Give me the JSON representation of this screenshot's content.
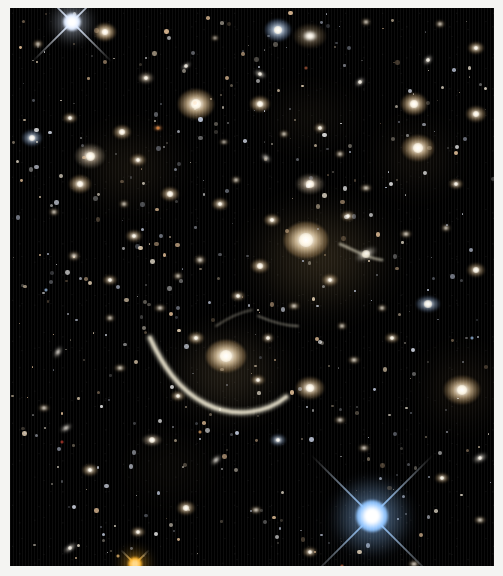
{
  "image": {
    "kind": "astronomical-deep-field-photograph",
    "subject": "galaxy cluster with gravitational lensing arc",
    "border_color": "#f4f4f2",
    "sky_color": "#000000",
    "width": 503,
    "height": 576,
    "plate": {
      "x": 10,
      "y": 8,
      "w": 484,
      "h": 558
    }
  },
  "palette": {
    "elliptical_core": "#fffaf0",
    "elliptical_halo": "#c8a878",
    "spiral_blue": "#cfe0f5",
    "star_white": "#ffffff",
    "star_blue": "#bcd8ff",
    "star_gold": "#ffc24a",
    "arc": "#e8e2cc",
    "red_dot": "#c0392b",
    "orange_dot": "#e07a30"
  },
  "diffuse_light": [
    {
      "x": 310,
      "y": 250,
      "rx": 78,
      "ry": 62,
      "color": "#8a7248",
      "alpha": 0.34
    },
    {
      "x": 218,
      "y": 365,
      "rx": 62,
      "ry": 50,
      "color": "#8a7450",
      "alpha": 0.3
    },
    {
      "x": 120,
      "y": 160,
      "rx": 58,
      "ry": 46,
      "color": "#6e5a3a",
      "alpha": 0.22
    },
    {
      "x": 408,
      "y": 150,
      "rx": 46,
      "ry": 40,
      "color": "#6a563a",
      "alpha": 0.2
    },
    {
      "x": 452,
      "y": 380,
      "rx": 44,
      "ry": 44,
      "color": "#6e5838",
      "alpha": 0.22
    },
    {
      "x": 300,
      "y": 110,
      "rx": 52,
      "ry": 34,
      "color": "#5e4e34",
      "alpha": 0.18
    },
    {
      "x": 160,
      "y": 460,
      "rx": 50,
      "ry": 40,
      "color": "#4e4028",
      "alpha": 0.14
    },
    {
      "x": 360,
      "y": 520,
      "rx": 56,
      "ry": 44,
      "color": "#3c4a60",
      "alpha": 0.16
    }
  ],
  "bright_stars": [
    {
      "name": "star-top-left-white",
      "x": 62,
      "y": 14,
      "size": 9,
      "color": "#ffffff",
      "spike": 56,
      "tint": "#dbe8ff"
    },
    {
      "name": "star-bottom-right-blue",
      "x": 362,
      "y": 508,
      "size": 16,
      "color": "#ffffff",
      "spike": 86,
      "tint": "#8fc4ff"
    },
    {
      "name": "star-bottom-gold",
      "x": 125,
      "y": 556,
      "size": 7,
      "color": "#ffd98a",
      "spike": 20,
      "tint": "#ffb224"
    }
  ],
  "lensing_arc": {
    "name": "dragon-arc",
    "color": "#e9e3cd",
    "description": "long curved gravitationally lensed arc sweeping below the central cluster galaxies"
  },
  "galaxies": [
    {
      "x": 95,
      "y": 24,
      "rx": 11,
      "ry": 9,
      "type": "elliptical",
      "b": 0.95
    },
    {
      "x": 28,
      "y": 36,
      "rx": 5,
      "ry": 4,
      "type": "elliptical",
      "b": 0.55
    },
    {
      "x": 176,
      "y": 58,
      "rx": 6,
      "ry": 3,
      "type": "edge-on",
      "b": 0.6,
      "rot": -35
    },
    {
      "x": 136,
      "y": 70,
      "rx": 8,
      "ry": 6,
      "type": "spiral",
      "b": 0.62
    },
    {
      "x": 268,
      "y": 22,
      "rx": 13,
      "ry": 11,
      "type": "spiral-blue",
      "b": 0.88
    },
    {
      "x": 250,
      "y": 66,
      "rx": 7,
      "ry": 4,
      "type": "edge-on",
      "b": 0.58,
      "rot": 25
    },
    {
      "x": 300,
      "y": 28,
      "rx": 16,
      "ry": 12,
      "type": "elliptical",
      "b": 0.45
    },
    {
      "x": 205,
      "y": 30,
      "rx": 4,
      "ry": 3,
      "type": "compact",
      "b": 0.5
    },
    {
      "x": 356,
      "y": 14,
      "rx": 5,
      "ry": 4,
      "type": "compact",
      "b": 0.5
    },
    {
      "x": 430,
      "y": 16,
      "rx": 5,
      "ry": 4,
      "type": "compact",
      "b": 0.55
    },
    {
      "x": 466,
      "y": 40,
      "rx": 8,
      "ry": 6,
      "type": "elliptical",
      "b": 0.72
    },
    {
      "x": 418,
      "y": 52,
      "rx": 6,
      "ry": 4,
      "type": "edge-on",
      "b": 0.6,
      "rot": -50
    },
    {
      "x": 350,
      "y": 74,
      "rx": 6,
      "ry": 4,
      "type": "edge-on",
      "b": 0.58,
      "rot": -40
    },
    {
      "x": 186,
      "y": 96,
      "rx": 18,
      "ry": 15,
      "type": "elliptical",
      "b": 1.0
    },
    {
      "x": 250,
      "y": 96,
      "rx": 10,
      "ry": 8,
      "type": "elliptical",
      "b": 0.8
    },
    {
      "x": 404,
      "y": 96,
      "rx": 13,
      "ry": 11,
      "type": "elliptical",
      "b": 0.9
    },
    {
      "x": 466,
      "y": 106,
      "rx": 10,
      "ry": 8,
      "type": "elliptical",
      "b": 0.75
    },
    {
      "x": 60,
      "y": 110,
      "rx": 7,
      "ry": 5,
      "type": "elliptical",
      "b": 0.6
    },
    {
      "x": 112,
      "y": 124,
      "rx": 9,
      "ry": 7,
      "type": "elliptical",
      "b": 0.72
    },
    {
      "x": 310,
      "y": 120,
      "rx": 6,
      "ry": 5,
      "type": "compact",
      "b": 0.6
    },
    {
      "x": 80,
      "y": 148,
      "rx": 15,
      "ry": 12,
      "type": "spiral",
      "b": 0.82
    },
    {
      "x": 128,
      "y": 152,
      "rx": 8,
      "ry": 6,
      "type": "elliptical",
      "b": 0.65
    },
    {
      "x": 70,
      "y": 176,
      "rx": 11,
      "ry": 9,
      "type": "elliptical",
      "b": 0.78
    },
    {
      "x": 22,
      "y": 130,
      "rx": 10,
      "ry": 8,
      "type": "spiral-blue",
      "b": 0.7
    },
    {
      "x": 148,
      "y": 120,
      "rx": 5,
      "ry": 3,
      "type": "orange-dot",
      "b": 0.5
    },
    {
      "x": 408,
      "y": 140,
      "rx": 16,
      "ry": 13,
      "type": "elliptical",
      "b": 0.95
    },
    {
      "x": 330,
      "y": 146,
      "rx": 5,
      "ry": 4,
      "type": "compact",
      "b": 0.55
    },
    {
      "x": 300,
      "y": 176,
      "rx": 14,
      "ry": 10,
      "type": "spiral",
      "b": 0.78
    },
    {
      "x": 256,
      "y": 150,
      "rx": 6,
      "ry": 4,
      "type": "edge-on",
      "b": 0.55,
      "rot": 40
    },
    {
      "x": 446,
      "y": 176,
      "rx": 7,
      "ry": 5,
      "type": "elliptical",
      "b": 0.62
    },
    {
      "x": 160,
      "y": 186,
      "rx": 9,
      "ry": 7,
      "type": "elliptical",
      "b": 0.72
    },
    {
      "x": 210,
      "y": 196,
      "rx": 8,
      "ry": 6,
      "type": "elliptical",
      "b": 0.68
    },
    {
      "x": 296,
      "y": 232,
      "rx": 22,
      "ry": 18,
      "type": "cD",
      "b": 1.0
    },
    {
      "x": 262,
      "y": 212,
      "rx": 8,
      "ry": 6,
      "type": "elliptical",
      "b": 0.7
    },
    {
      "x": 338,
      "y": 208,
      "rx": 7,
      "ry": 5,
      "type": "elliptical",
      "b": 0.62
    },
    {
      "x": 250,
      "y": 258,
      "rx": 9,
      "ry": 7,
      "type": "elliptical",
      "b": 0.72
    },
    {
      "x": 320,
      "y": 272,
      "rx": 8,
      "ry": 6,
      "type": "elliptical",
      "b": 0.68
    },
    {
      "x": 356,
      "y": 246,
      "rx": 12,
      "ry": 6,
      "type": "edge-on",
      "b": 0.7,
      "rot": -28
    },
    {
      "x": 228,
      "y": 288,
      "rx": 7,
      "ry": 5,
      "type": "elliptical",
      "b": 0.6
    },
    {
      "x": 284,
      "y": 298,
      "rx": 6,
      "ry": 4,
      "type": "compact",
      "b": 0.55
    },
    {
      "x": 124,
      "y": 228,
      "rx": 8,
      "ry": 6,
      "type": "elliptical",
      "b": 0.65
    },
    {
      "x": 64,
      "y": 248,
      "rx": 6,
      "ry": 5,
      "type": "compact",
      "b": 0.55
    },
    {
      "x": 100,
      "y": 272,
      "rx": 7,
      "ry": 5,
      "type": "elliptical",
      "b": 0.6
    },
    {
      "x": 150,
      "y": 300,
      "rx": 6,
      "ry": 4,
      "type": "compact",
      "b": 0.55
    },
    {
      "x": 418,
      "y": 296,
      "rx": 12,
      "ry": 8,
      "type": "spiral-blue",
      "b": 0.7
    },
    {
      "x": 466,
      "y": 262,
      "rx": 9,
      "ry": 7,
      "type": "elliptical",
      "b": 0.66
    },
    {
      "x": 216,
      "y": 348,
      "rx": 20,
      "ry": 16,
      "type": "cD",
      "b": 0.98
    },
    {
      "x": 186,
      "y": 330,
      "rx": 8,
      "ry": 6,
      "type": "elliptical",
      "b": 0.7
    },
    {
      "x": 258,
      "y": 330,
      "rx": 6,
      "ry": 5,
      "type": "compact",
      "b": 0.6
    },
    {
      "x": 248,
      "y": 372,
      "rx": 7,
      "ry": 5,
      "type": "elliptical",
      "b": 0.62
    },
    {
      "x": 168,
      "y": 388,
      "rx": 7,
      "ry": 5,
      "type": "elliptical",
      "b": 0.6
    },
    {
      "x": 300,
      "y": 380,
      "rx": 14,
      "ry": 11,
      "type": "elliptical",
      "b": 0.85
    },
    {
      "x": 344,
      "y": 352,
      "rx": 6,
      "ry": 4,
      "type": "compact",
      "b": 0.55
    },
    {
      "x": 452,
      "y": 382,
      "rx": 18,
      "ry": 14,
      "type": "elliptical",
      "b": 0.95
    },
    {
      "x": 382,
      "y": 330,
      "rx": 7,
      "ry": 5,
      "type": "elliptical",
      "b": 0.6
    },
    {
      "x": 110,
      "y": 360,
      "rx": 6,
      "ry": 4,
      "type": "compact",
      "b": 0.55
    },
    {
      "x": 48,
      "y": 344,
      "rx": 7,
      "ry": 4,
      "type": "edge-on",
      "b": 0.55,
      "rot": -60
    },
    {
      "x": 34,
      "y": 400,
      "rx": 6,
      "ry": 4,
      "type": "compact",
      "b": 0.5
    },
    {
      "x": 142,
      "y": 432,
      "rx": 10,
      "ry": 6,
      "type": "spiral",
      "b": 0.68
    },
    {
      "x": 80,
      "y": 462,
      "rx": 8,
      "ry": 6,
      "type": "elliptical",
      "b": 0.65
    },
    {
      "x": 56,
      "y": 420,
      "rx": 7,
      "ry": 4,
      "type": "edge-on",
      "b": 0.55,
      "rot": -30
    },
    {
      "x": 206,
      "y": 452,
      "rx": 7,
      "ry": 4,
      "type": "edge-on",
      "b": 0.55,
      "rot": -45
    },
    {
      "x": 268,
      "y": 432,
      "rx": 8,
      "ry": 6,
      "type": "spiral-blue",
      "b": 0.6
    },
    {
      "x": 176,
      "y": 500,
      "rx": 9,
      "ry": 7,
      "type": "elliptical",
      "b": 0.7
    },
    {
      "x": 246,
      "y": 502,
      "rx": 6,
      "ry": 4,
      "type": "compact",
      "b": 0.55
    },
    {
      "x": 128,
      "y": 524,
      "rx": 7,
      "ry": 5,
      "type": "elliptical",
      "b": 0.62
    },
    {
      "x": 60,
      "y": 540,
      "rx": 8,
      "ry": 4,
      "type": "edge-on",
      "b": 0.6,
      "rot": -35
    },
    {
      "x": 300,
      "y": 544,
      "rx": 7,
      "ry": 5,
      "type": "elliptical",
      "b": 0.6
    },
    {
      "x": 432,
      "y": 470,
      "rx": 7,
      "ry": 5,
      "type": "elliptical",
      "b": 0.6
    },
    {
      "x": 470,
      "y": 512,
      "rx": 6,
      "ry": 4,
      "type": "compact",
      "b": 0.55
    },
    {
      "x": 404,
      "y": 556,
      "rx": 6,
      "ry": 4,
      "type": "compact",
      "b": 0.5
    },
    {
      "x": 470,
      "y": 450,
      "rx": 8,
      "ry": 5,
      "type": "edge-on",
      "b": 0.6,
      "rot": -25
    },
    {
      "x": 354,
      "y": 440,
      "rx": 6,
      "ry": 4,
      "type": "compact",
      "b": 0.5
    },
    {
      "x": 332,
      "y": 318,
      "rx": 5,
      "ry": 4,
      "type": "compact",
      "b": 0.5
    },
    {
      "x": 396,
      "y": 226,
      "rx": 6,
      "ry": 4,
      "type": "compact",
      "b": 0.55
    },
    {
      "x": 372,
      "y": 300,
      "rx": 5,
      "ry": 4,
      "type": "compact",
      "b": 0.5
    },
    {
      "x": 190,
      "y": 252,
      "rx": 6,
      "ry": 5,
      "type": "compact",
      "b": 0.55
    },
    {
      "x": 168,
      "y": 268,
      "rx": 5,
      "ry": 4,
      "type": "compact",
      "b": 0.5
    },
    {
      "x": 226,
      "y": 172,
      "rx": 5,
      "ry": 4,
      "type": "compact",
      "b": 0.5
    },
    {
      "x": 356,
      "y": 180,
      "rx": 6,
      "ry": 4,
      "type": "compact",
      "b": 0.55
    },
    {
      "x": 44,
      "y": 204,
      "rx": 5,
      "ry": 4,
      "type": "compact",
      "b": 0.5
    },
    {
      "x": 436,
      "y": 220,
      "rx": 5,
      "ry": 4,
      "type": "compact",
      "b": 0.5
    },
    {
      "x": 274,
      "y": 126,
      "rx": 5,
      "ry": 4,
      "type": "compact",
      "b": 0.5
    },
    {
      "x": 214,
      "y": 134,
      "rx": 5,
      "ry": 3,
      "type": "compact",
      "b": 0.45
    },
    {
      "x": 114,
      "y": 196,
      "rx": 5,
      "ry": 4,
      "type": "compact",
      "b": 0.5
    },
    {
      "x": 330,
      "y": 412,
      "rx": 6,
      "ry": 4,
      "type": "compact",
      "b": 0.5
    },
    {
      "x": 100,
      "y": 310,
      "rx": 5,
      "ry": 4,
      "type": "compact",
      "b": 0.5
    }
  ]
}
